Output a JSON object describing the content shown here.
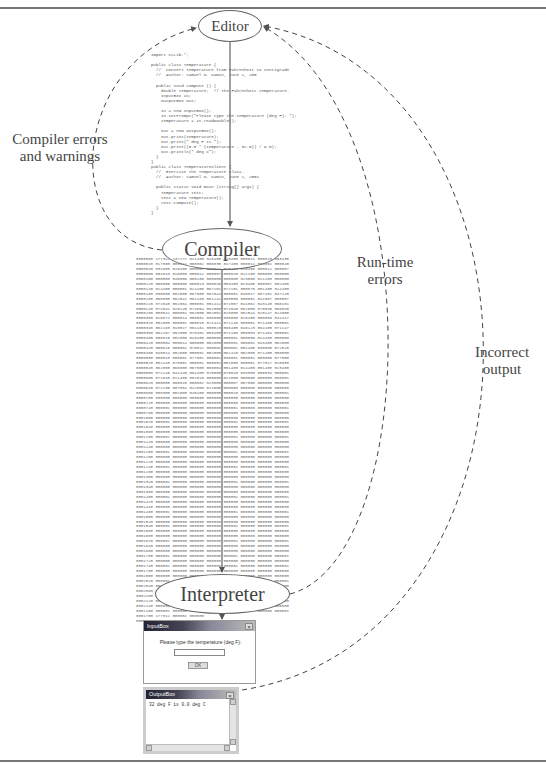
{
  "diagram": {
    "nodes": {
      "editor": "Editor",
      "compiler": "Compiler",
      "interpreter": "Interpreter"
    },
    "feedback_labels": {
      "compiler_errors": "Compiler errors\nand warnings",
      "runtime_errors": "Run-time\nerrors",
      "incorrect_output": "Incorrect\noutput"
    },
    "source_code": "import CSLib.*;\n\npublic class Temperature {\n  //  Convert temperature from Fahrenheit to Centigrade\n  //  Author: Samuel N. Kamin, June 1, 200\n\n  public void compute () {\n    double temperature;  // The Fahrenheit temperature.\n    InputBox in;\n    OutputBox out;\n\n    in = new InputBox();\n    in.setPrompt(\"Please type the temperature (deg F): \");\n    temperature = in.readDouble();\n\n    out = new OutputBox();\n    out.print(temperature);\n    out.print(\" deg F is \");\n    out.print((5.0 * (temperature - 32.0)) / 9.0);\n    out.println(\" deg C\");\n  }\n}\npublic class TemperatureClient {\n  //  Exercise the Temperature class.\n  //  Author: Samuel N. Kamin, June 1, 2001\n\n  public static void main (String[] args) {\n    Temperature test;\n    test = new Temperature();\n    test.compute();\n  }\n}",
    "bytecode_dump": "0000000 177312 137272 021400 026400 010400 000012 000020 003435\n0000020 017000 000012 000002 006035 017400 000012 000002 005040\n0000040 031000 020400 000007 005042 010400 016400 000012 000007\n0000060 004043 010000 000012 000007 000045 012100 000000 000000\n0000100 000050 048006 000100 000000 000000 023000 021100 000000\n0000120 000000 000000 000013 000046 003400 023400 000007 002400\n0000140 024400 000001 024406 067151 072151 000670 001400 024450\n0000160 030000 002000 067000 062544 000001 046017 067151 047145\n0000200 066000 062542 062163 061141 060556 000001 041607 060557\n0000220 072040 062064 000001 051412 072057 041562 043145 060151\n0000240 071541 020145 074664 062000 072040 062000 070045 066045\n0000260 000042 000002 062500 062552 026000 062544 020147 024050\n0000300 026072 000014 000002 036000 036000 026400 000003 041417\n0000320 001000 000001 000010 071411 071146 000001 071405 000001\n0000340 062163 010017 061162 000023 060400 046123 064100 071147\n0000360 061157 002000 070401 003400 071106 000003 071404 000001\n0000400 000015 002000 043400 000000 000001 000000 014400 000000\n0000420 000004 000014 000000 002000 000001 000001 043400 002000\n0000440 000016 000001 070012 000001 000001 051400 030000 072020\n0000460 040014 002000 000001 002000 062410 002000 071400 000000\n0000500 000010 000001 077001 000001 036001 000001 050000 077000\n0000520 062440 070002 000002 000001 002000 000001 077017 020000\n0000540 062000 066000 067000 066004 001400 024450 001400 023400\n0000560 071146 041440 064400 070000 070010 034000 000034 000001\n0000600 071040 021400 001015 000000 021000 000000 000000 000001\n0000620 000000 000010 000002 023000 000007 007000 000000 000000\n0000640 072130 007004 012000 021000 000000 000000 000000 000000\n0000660 000300 001000 040400 000000 000010 000000 000000 000001\n0000700 030000 000000 000000 000000 000000 000000 000000 000000\n0000720 000000 000000 000000 000000 000000 000000 000000 000000\n0000740 000001 000000 000000 000000 000001 000000 000000 000001\n0000760 000000 000000 000000 000000 000000 000000 000000 000000\n0001000 000000 000000 000000 000000 000000 000000 000000 000000\n0001020 000001 000000 000000 000000 000001 000000 000000 000001\n0001040 000000 000000 000000 000000 000000 000000 000000 000000\n0001060 000000 000000 000000 000000 000000 000000 000000 000000\n0001100 000001 000000 000000 000000 000001 000000 000000 000001\n0001120 000000 000000 000000 000000 000000 000000 000000 000000\n0001140 000000 000000 000000 000000 000000 000000 000000 000000\n0001160 000001 000000 000000 000000 000001 000000 000000 000001\n0001200 000000 000000 000000 000000 000000 000000 000000 000000\n0001220 000000 000000 000000 000000 000000 000000 000000 000000\n0001240 000001 000000 000000 000000 000001 000000 000000 000001\n0001260 000000 000000 000000 000000 000000 000000 000000 000000\n0001300 000000 000000 000000 000000 000000 000000 000000 000000\n0001320 000001 000000 000000 000000 000001 000000 000000 000001\n0001340 000000 000000 000000 000000 000000 000000 000000 000000\n0001360 000000 000000 000000 000000 000000 000000 000000 000000\n0001400 000001 000000 000000 000000 000001 000000 000000 000001\n0001420 000000 000000 000000 000000 000000 000000 000000 000000\n0001440 000000 000000 000000 000000 000000 000000 000000 000000\n0001460 000001 000000 000000 000000 000001 000000 000000 000001\n0001500 000000 000000 000000 000000 000000 000000 000000 000000\n0001520 000000 000000 000000 000000 000000 000000 000000 000000\n0001540 000001 000000 000000 000000 000001 000000 000000 000001\n0001560 000000 000000 000000 000000 000000 000000 000000 000000\n0001600 000000 000000 000000 000000 000000 000000 000000 000000\n0001620 000001 000000 000000 000000 000001 000000 000000 000001\n0001640 000000 000000 000000 000000 000000 000000 000000 000000\n0001660 000000 000000 000000 000000 000000 000000 000000 000000\n0001700 000001 000000 000000 000000 000001 000000 000000 000001\n0001720 000000 000000 000000 000000 000000 000000 000000 000000\n0001740 000001 000000 000000 000000 000001 000000 000000 000001\n0001760 000000 000000 000000 000000 000000 000000 000000 000000\n0002000 000000 000000 000000 000000 000000 000000 000000 000000\n0002020 000001 000000 000000 000000 000001 000000 000000 000001\n0002040 000000 000000 000000 000000 000000 000000 000000 000000\n0002060 000000 000000 000000 000000 000000 000000 000000 000000\n0002100 000001 000000 000000 000000 000001 000000 000000 000001\n0002120 000000 000000 000000 000000 000000 000000 000000 000000\n0002140 000000 000000 000000 000000 000000 000000 000000 000000\n0002160 000001 000000 000000 000000 000001 000000 000000 000001\n0001700 177312 000002 000000\n0001703",
    "input_box": {
      "title": "InputBox",
      "close": "×",
      "prompt": "Please type the temperature (deg F):",
      "field_value": "",
      "ok_label": "OK"
    },
    "output_box": {
      "title": "OutputBox",
      "close": "×",
      "text": "32 deg F is 0.0 deg C"
    }
  }
}
